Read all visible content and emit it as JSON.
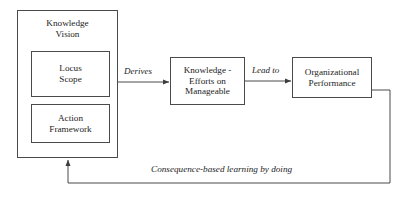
{
  "diagram": {
    "colors": {
      "stroke": "#4a4a4a",
      "text": "#1d1d1d",
      "background": "#ffffff"
    },
    "outer_box": {
      "title_line1": "Knowledge",
      "title_line2": "Vision"
    },
    "nodes": [
      {
        "id": "locus-scope",
        "line1": "Locus",
        "line2": "Scope"
      },
      {
        "id": "action-framework",
        "line1": "Action",
        "line2": "Framework"
      },
      {
        "id": "knowledge-efforts",
        "line1": "Knowledge -",
        "line2": "Efforts on",
        "line3": "Manageable"
      },
      {
        "id": "organizational-performance",
        "line1": "Organizational",
        "line2": "Performance"
      }
    ],
    "edges": {
      "derives": "Derives",
      "lead_to": "Lead to",
      "feedback": "Consequence-based learning by doing"
    }
  }
}
